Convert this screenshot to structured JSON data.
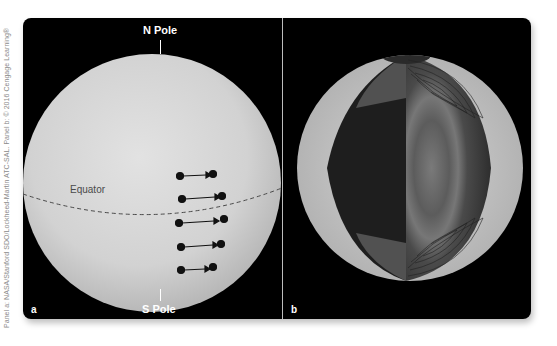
{
  "credit": "Panel a: NASA/Stanford SDO/Lockheed-Martin ATC-SAL. Panel b: © 2016 Cengage Learning®",
  "panel_a": {
    "label": "a",
    "north_label": "N Pole",
    "south_label": "S Pole",
    "equator_label": "Equator",
    "sunspot_arrows": [
      {
        "y": 158,
        "x1": 180,
        "x2": 210
      },
      {
        "y": 180,
        "x1": 182,
        "x2": 206
      },
      {
        "y": 206,
        "x1": 180,
        "x2": 215
      },
      {
        "y": 229,
        "x1": 182,
        "x2": 205
      },
      {
        "y": 252,
        "x1": 181,
        "x2": 205
      }
    ]
  },
  "panel_b": {
    "label": "b",
    "description": "Cutaway of the Sun showing interior rotation/convection with contour lines"
  },
  "colors": {
    "background": "#000000",
    "sun_surface": "#d8d8d8",
    "divider": "#bdbdbd"
  }
}
